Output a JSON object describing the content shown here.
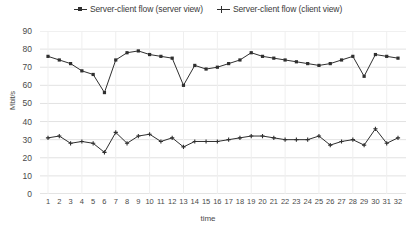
{
  "chart_data": {
    "type": "line",
    "title": "",
    "xlabel": "time",
    "ylabel": "Mbit/s",
    "grid": "horizontal-and-vertical-faint",
    "legend_position": "top-center",
    "ylim": [
      0,
      90
    ],
    "yticks": [
      0,
      10,
      20,
      30,
      40,
      50,
      60,
      70,
      80,
      90
    ],
    "categories": [
      1,
      2,
      3,
      4,
      5,
      6,
      7,
      8,
      9,
      10,
      11,
      12,
      13,
      14,
      15,
      16,
      17,
      18,
      19,
      20,
      21,
      22,
      23,
      24,
      25,
      26,
      27,
      28,
      29,
      30,
      31,
      32
    ],
    "series": [
      {
        "name": "Server-client flow (server view)",
        "marker": "filled-square",
        "color": "#2f2f2f",
        "values": [
          76,
          74,
          72,
          68,
          66,
          56,
          74,
          78,
          79,
          77,
          76,
          75,
          60,
          71,
          69,
          70,
          72,
          74,
          78,
          76,
          75,
          74,
          73,
          72,
          71,
          72,
          74,
          76,
          65,
          77,
          76,
          75
        ]
      },
      {
        "name": "Server-client flow (client view)",
        "marker": "cross",
        "color": "#2f2f2f",
        "values": [
          31,
          32,
          28,
          29,
          28,
          23,
          34,
          28,
          32,
          33,
          29,
          31,
          26,
          29,
          29,
          29,
          30,
          31,
          32,
          32,
          31,
          30,
          30,
          30,
          32,
          27,
          29,
          30,
          27,
          36,
          28,
          31
        ]
      }
    ]
  },
  "legend": {
    "entries": [
      {
        "label": "Server-client flow (server view)",
        "marker": "square-marker-icon"
      },
      {
        "label": "Server-client flow (client view)",
        "marker": "cross-marker-icon"
      }
    ]
  },
  "axes": {
    "y_title": "Mbit/s",
    "x_title": "time"
  }
}
